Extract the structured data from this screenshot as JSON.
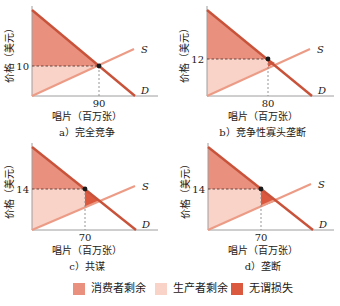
{
  "colors": {
    "consumer_surplus": "#e9907f",
    "producer_surplus": "#f9d3c8",
    "deadweight_loss": "#db5a3f",
    "demand_line": "#c8533a",
    "supply_line": "#ec9c86",
    "axis": "#9e9e9e",
    "dashed": "#5a3a33",
    "point": "#1a1a1a"
  },
  "legend": {
    "items": [
      {
        "label": "消费者剩余",
        "color_key": "consumer_surplus"
      },
      {
        "label": "生产者剩余",
        "color_key": "producer_surplus"
      },
      {
        "label": "无谓损失",
        "color_key": "deadweight_loss"
      }
    ]
  },
  "chart_data": [
    {
      "type": "area",
      "panel": "a",
      "title": "a）完全竞争",
      "xlabel": "唱片（百万张）",
      "ylabel": "价格（美元）",
      "curves": {
        "supply_label": "S",
        "demand_label": "D"
      },
      "price": 10,
      "quantity": 90,
      "price_label": "10",
      "quantity_label": "90",
      "has_deadweight_loss": false,
      "geometry": {
        "axis_x": 32,
        "baseline_y": 96,
        "axis_right": 158,
        "demand_start": [
          32,
          10
        ],
        "demand_end": [
          135,
          96
        ],
        "supply_start": [
          32,
          96
        ],
        "supply_end": [
          134,
          49
        ],
        "market_point": [
          99,
          66
        ],
        "supply_at_q": [
          99,
          66
        ],
        "intersection": [
          99,
          66
        ]
      }
    },
    {
      "type": "area",
      "panel": "b",
      "title": "b）竞争性寡头垄断",
      "xlabel": "唱片（百万张）",
      "ylabel": "价格（美元）",
      "curves": {
        "supply_label": "S",
        "demand_label": "D"
      },
      "price": 12,
      "quantity": 80,
      "price_label": "12",
      "quantity_label": "80",
      "has_deadweight_loss": true,
      "geometry": {
        "axis_x": 207,
        "baseline_y": 96,
        "axis_right": 334,
        "demand_start": [
          207,
          10
        ],
        "demand_end": [
          312,
          96
        ],
        "supply_start": [
          207,
          96
        ],
        "supply_end": [
          310,
          49
        ],
        "market_point": [
          268,
          59
        ],
        "supply_at_q": [
          268,
          67
        ],
        "intersection": [
          275,
          63
        ]
      }
    },
    {
      "type": "area",
      "panel": "c",
      "title": "c）共谋",
      "xlabel": "唱片（百万张）",
      "ylabel": "价格（美元）",
      "curves": {
        "supply_label": "S",
        "demand_label": "D"
      },
      "price": 14,
      "quantity": 70,
      "price_label": "14",
      "quantity_label": "70",
      "has_deadweight_loss": true,
      "geometry": {
        "axis_x": 32,
        "baseline_y": 230,
        "axis_right": 158,
        "demand_start": [
          32,
          147
        ],
        "demand_end": [
          136,
          230
        ],
        "supply_start": [
          32,
          230
        ],
        "supply_end": [
          135,
          186
        ],
        "market_point": [
          85,
          189
        ],
        "supply_at_q": [
          85,
          208
        ],
        "intersection": [
          100,
          201
        ]
      }
    },
    {
      "type": "area",
      "panel": "d",
      "title": "d）垄断",
      "xlabel": "唱片（百万张）",
      "ylabel": "价格（美元）",
      "curves": {
        "supply_label": "S",
        "demand_label": "D"
      },
      "price": 14,
      "quantity": 70,
      "price_label": "14",
      "quantity_label": "70",
      "has_deadweight_loss": true,
      "geometry": {
        "axis_x": 208,
        "baseline_y": 230,
        "axis_right": 334,
        "demand_start": [
          208,
          147
        ],
        "demand_end": [
          313,
          230
        ],
        "supply_start": [
          208,
          230
        ],
        "supply_end": [
          311,
          184
        ],
        "market_point": [
          261,
          189
        ],
        "supply_at_q": [
          261,
          207
        ],
        "intersection": [
          276,
          201
        ]
      }
    }
  ]
}
